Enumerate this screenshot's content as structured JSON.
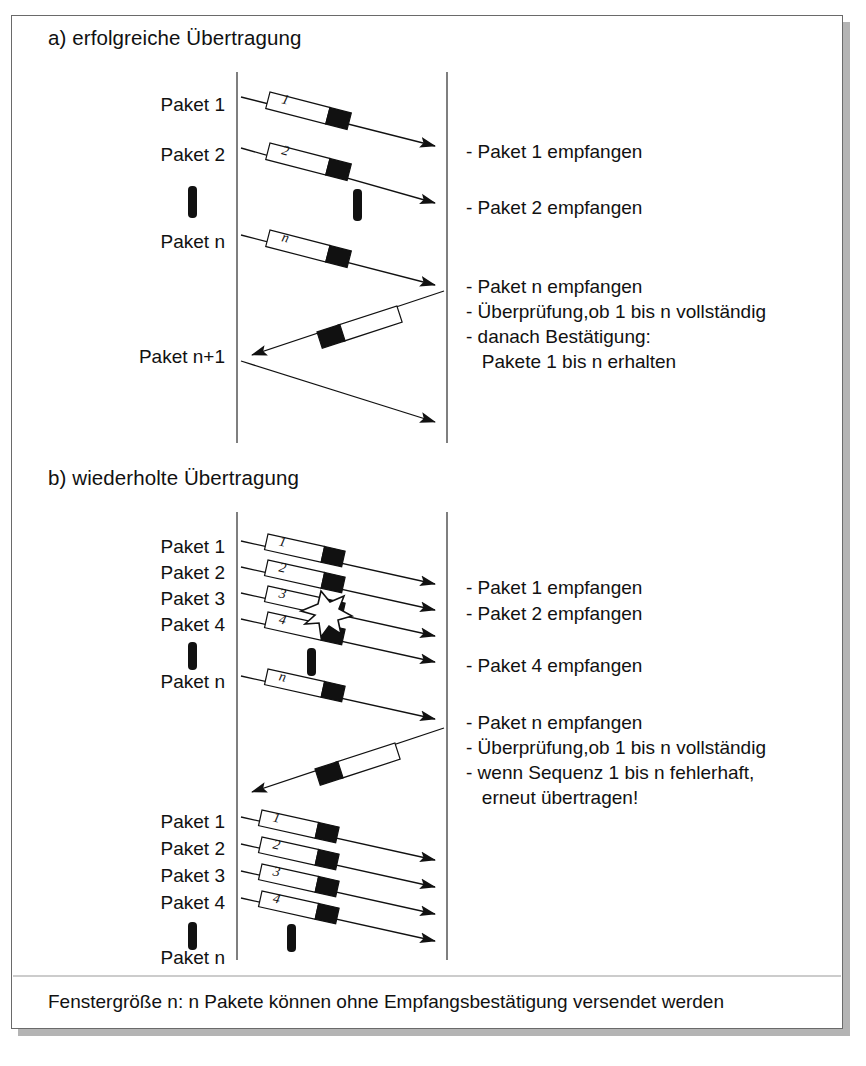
{
  "figure": {
    "background_color": "#ffffff",
    "frame_color": "#6a6a6a",
    "ink_color": "#111111",
    "shadow_color": "#b4b4b4"
  },
  "sections": [
    {
      "id": "a",
      "title": "a) erfolgreiche Übertragung",
      "sender_labels": [
        {
          "text": "Paket 1",
          "y": 105
        },
        {
          "text": "Paket 2",
          "y": 155
        },
        {
          "text": "Paket n",
          "y": 242
        },
        {
          "text": "Paket n+1",
          "y": 357
        }
      ],
      "ellipsis_marks": [
        {
          "name": "sender-ellipsis",
          "x": 193,
          "y": 190
        },
        {
          "name": "channel-ellipsis",
          "x": 358,
          "y": 193
        }
      ],
      "data_packets": [
        {
          "number": "1",
          "y": 100
        },
        {
          "number": "2",
          "y": 150
        },
        {
          "number": "n",
          "y": 237
        }
      ],
      "ack_packet": {
        "number": "",
        "label": "acknowledgement"
      },
      "receiver_notes": [
        "- Paket 1 empfangen",
        "- Paket 2 empfangen",
        "- Paket n empfangen",
        "- Überprüfung,ob 1 bis n vollständig",
        "- danach Bestätigung:",
        "   Pakete 1 bis n erhalten"
      ]
    },
    {
      "id": "b",
      "title": "b) wiederholte Übertragung",
      "sender_labels": [
        {
          "text": "Paket 1",
          "y": 547
        },
        {
          "text": "Paket 2",
          "y": 573
        },
        {
          "text": "Paket 3",
          "y": 599
        },
        {
          "text": "Paket 4",
          "y": 625
        },
        {
          "text": "Paket n",
          "y": 682
        },
        {
          "text": "Paket 1",
          "y": 822
        },
        {
          "text": "Paket 2",
          "y": 849
        },
        {
          "text": "Paket 3",
          "y": 876
        },
        {
          "text": "Paket 4",
          "y": 903
        },
        {
          "text": "Paket n",
          "y": 958
        }
      ],
      "ellipsis_marks": [
        {
          "name": "sender-ellipsis-upper",
          "x": 193,
          "y": 648
        },
        {
          "name": "channel-ellipsis-upper",
          "x": 312,
          "y": 655
        },
        {
          "name": "sender-ellipsis-lower",
          "x": 193,
          "y": 928
        },
        {
          "name": "channel-ellipsis-lower",
          "x": 292,
          "y": 930
        }
      ],
      "data_packets": [
        {
          "number": "1",
          "y": 542
        },
        {
          "number": "2",
          "y": 568
        },
        {
          "number": "3",
          "y": 594,
          "lost": true
        },
        {
          "number": "4",
          "y": 620
        },
        {
          "number": "n",
          "y": 677
        },
        {
          "number": "1",
          "y": 818
        },
        {
          "number": "2",
          "y": 845
        },
        {
          "number": "3",
          "y": 872
        },
        {
          "number": "4",
          "y": 899
        }
      ],
      "error_marker": {
        "name": "packet-loss-starburst",
        "x": 326,
        "y": 612
      },
      "receiver_notes": [
        "- Paket 1 empfangen",
        "- Paket 2 empfangen",
        "- Paket 4 empfangen",
        "- Paket n empfangen",
        "- Überprüfung,ob 1 bis n vollständig",
        "- wenn Sequenz 1 bis n fehlerhaft,",
        "   erneut übertragen!"
      ]
    }
  ],
  "caption": "Fenstergröße n: n Pakete können ohne Empfangsbestätigung versendet werden",
  "timelines": {
    "sender_x": 237,
    "receiver_x": 447,
    "section_a_top": 72,
    "section_a_bottom": 443,
    "section_b_top": 512,
    "section_b_bottom": 960
  }
}
